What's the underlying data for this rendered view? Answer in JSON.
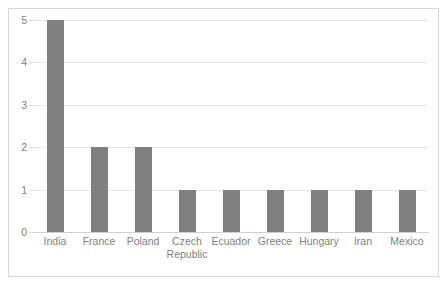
{
  "chart_data": {
    "type": "bar",
    "title": "",
    "subtitle": "",
    "xlabel": "",
    "ylabel": "",
    "categories": [
      "India",
      "France",
      "Poland",
      "Czech Republic",
      "Ecuador",
      "Greece",
      "Hungary",
      "Iran",
      "Mexico"
    ],
    "values": [
      5,
      2,
      2,
      1,
      1,
      1,
      1,
      1,
      1
    ],
    "ylim": [
      0,
      5
    ],
    "yticks": [
      "0",
      "1",
      "2",
      "3",
      "4",
      "5"
    ],
    "grid": true,
    "legend": false,
    "legend_position": "none",
    "orientation": "vertical",
    "bar_color": "#808080",
    "gridline_color": "#e8e8e8",
    "axis_text_color": "#7f7f7f",
    "plot_background": "#ffffff",
    "border_color": "#d9d9d9"
  }
}
